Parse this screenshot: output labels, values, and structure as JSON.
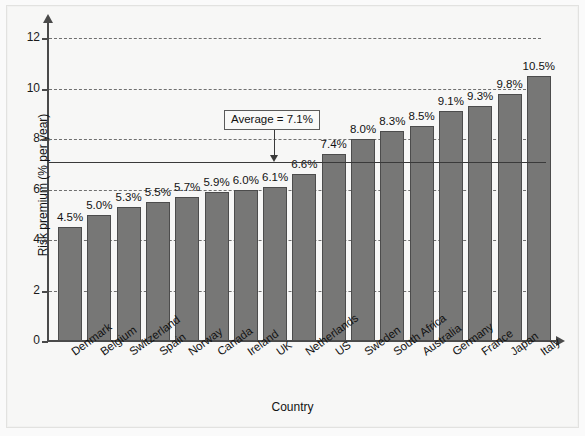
{
  "chart_data": {
    "type": "bar",
    "title": "",
    "xlabel": "Country",
    "ylabel": "Risk premium (% per year)",
    "categories": [
      "Denmark",
      "Belgium",
      "Switzerland",
      "Spain",
      "Norway",
      "Canada",
      "Ireland",
      "UK",
      "Netherlands",
      "US",
      "Sweden",
      "South Africa",
      "Australia",
      "Germany",
      "France",
      "Japan",
      "Italy"
    ],
    "values": [
      4.5,
      5.0,
      5.3,
      5.5,
      5.7,
      5.9,
      6.0,
      6.1,
      6.6,
      7.4,
      8.0,
      8.3,
      8.5,
      9.1,
      9.3,
      9.8,
      10.5
    ],
    "value_labels": [
      "4.5%",
      "5.0%",
      "5.3%",
      "5.5%",
      "5.7%",
      "5.9%",
      "6.0%",
      "6.1%",
      "6.6%",
      "7.4%",
      "8.0%",
      "8.3%",
      "8.5%",
      "9.1%",
      "9.3%",
      "9.8%",
      "10.5%"
    ],
    "ylim": [
      0,
      12.6
    ],
    "yticks": [
      0,
      2,
      4,
      6,
      8,
      10,
      12
    ],
    "ytick_labels": [
      "0",
      "2",
      "4",
      "6",
      "8",
      "10",
      "12"
    ],
    "grid": true,
    "grid_style": "dashed",
    "legend": "none",
    "annotations": [
      {
        "name": "average-line",
        "label": "Average = 7.1%",
        "value": 7.1,
        "type": "horizontal-reference-line-with-callout"
      }
    ],
    "colors": {
      "bar_fill": "#777776",
      "bar_stroke": "#4c4c4c",
      "axis": "#4a4a4a",
      "grid": "#6f6f6f",
      "average_line": "#3a3a3a",
      "background": "#f7f7f6"
    }
  }
}
